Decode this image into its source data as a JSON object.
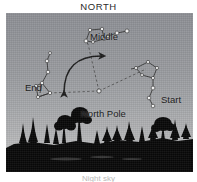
{
  "figure": {
    "title": "NORTH",
    "caption": "Night sky",
    "type": "astronomy-diagram",
    "sky_color_top": "#8e9095",
    "sky_color_horizon": "#cacacb",
    "ground_color": "#0a0a0a",
    "star_color": "#f2f2f2",
    "line_color": "#3a3a3a"
  },
  "labels": {
    "middle": "Middle",
    "end": "End",
    "start": "Start",
    "north_pole": "North Pole"
  },
  "diagram_data": {
    "description": "The Big Dipper shown at three positions as it rotates counterclockwise about the North Pole during the night.",
    "pivot": {
      "name": "North Pole",
      "x": 99,
      "y": 91
    },
    "rotation_direction": "counterclockwise",
    "arc_arrow": {
      "heads": 2,
      "from": "Start side",
      "to": "End side"
    },
    "positions": [
      {
        "name": "Start",
        "label_x": 155,
        "label_y": 81,
        "stars": [
          {
            "x": 136,
            "y": 67
          },
          {
            "x": 149,
            "y": 63
          },
          {
            "x": 160,
            "y": 67
          },
          {
            "x": 162,
            "y": 77
          },
          {
            "x": 151,
            "y": 81
          },
          {
            "x": 148,
            "y": 92
          },
          {
            "x": 145,
            "y": 101
          },
          {
            "x": 153,
            "y": 107
          }
        ]
      },
      {
        "name": "Middle",
        "label_x": 84,
        "label_y": 18,
        "stars": [
          {
            "x": 86,
            "y": 41
          },
          {
            "x": 90,
            "y": 30
          },
          {
            "x": 102,
            "y": 29
          },
          {
            "x": 104,
            "y": 39
          },
          {
            "x": 93,
            "y": 42
          },
          {
            "x": 108,
            "y": 36
          },
          {
            "x": 117,
            "y": 33
          },
          {
            "x": 127,
            "y": 31
          }
        ]
      },
      {
        "name": "End",
        "label_x": 19,
        "label_y": 69,
        "stars": [
          {
            "x": 47,
            "y": 42
          },
          {
            "x": 49,
            "y": 52
          },
          {
            "x": 47,
            "y": 62
          },
          {
            "x": 40,
            "y": 72
          },
          {
            "x": 51,
            "y": 76
          },
          {
            "x": 54,
            "y": 87
          },
          {
            "x": 44,
            "y": 92
          },
          {
            "x": 41,
            "y": 81
          }
        ]
      }
    ],
    "guide_lines": [
      {
        "from": "North Pole",
        "to": "Start",
        "style": "dashed"
      },
      {
        "from": "North Pole",
        "to": "Middle",
        "style": "dashed"
      },
      {
        "from": "North Pole",
        "to": "End",
        "style": "dashed"
      }
    ],
    "horizon": "black silhouette of coniferous and deciduous treeline"
  }
}
